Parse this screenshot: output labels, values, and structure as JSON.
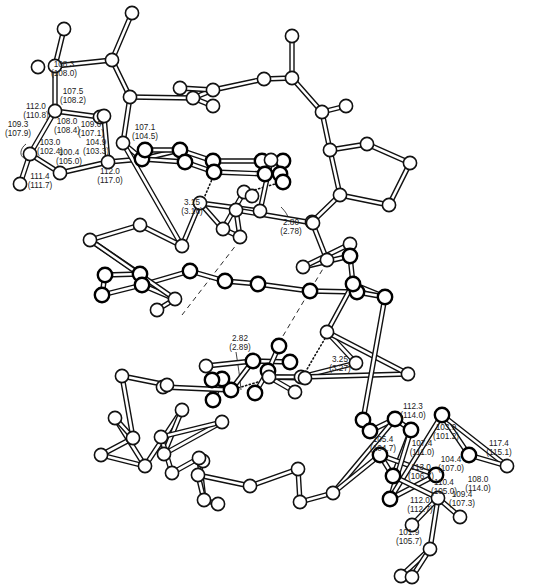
{
  "figure": {
    "angle_labels_upper": [
      {
        "value": "108.3",
        "alt": "(108.0)",
        "x": 64,
        "y": 67
      },
      {
        "value": "107.5",
        "alt": "(108.2)",
        "x": 73,
        "y": 94
      },
      {
        "value": "112.0",
        "alt": "(110.8)",
        "x": 36,
        "y": 109
      },
      {
        "value": "108.0",
        "alt": "(108.4)",
        "x": 67,
        "y": 124
      },
      {
        "value": "109.0",
        "alt": "(107.1)",
        "x": 91,
        "y": 127
      },
      {
        "value": "109.3",
        "alt": "(107.9)",
        "x": 18,
        "y": 127
      },
      {
        "value": "107.1",
        "alt": "(104.5)",
        "x": 145,
        "y": 130
      },
      {
        "value": "103.0",
        "alt": "(102.4)",
        "x": 50,
        "y": 145
      },
      {
        "value": "104.9",
        "alt": "(103.3)",
        "x": 96,
        "y": 145
      },
      {
        "value": "100.4",
        "alt": "(105.0)",
        "x": 69,
        "y": 155
      },
      {
        "value": "112.0",
        "alt": "(117.0)",
        "x": 110,
        "y": 174
      },
      {
        "value": "111.4",
        "alt": "(111.7)",
        "x": 40,
        "y": 179
      }
    ],
    "distance_labels": [
      {
        "value": "3.15",
        "alt": "(3.16)",
        "x": 192,
        "y": 205
      },
      {
        "value": "2.80",
        "alt": "(2.78)",
        "x": 291,
        "y": 225
      },
      {
        "value": "2.82",
        "alt": "(2.89)",
        "x": 240,
        "y": 341
      },
      {
        "value": "3.25",
        "alt": "(3.27)",
        "x": 340,
        "y": 362
      }
    ],
    "angle_labels_lower": [
      {
        "value": "112.3",
        "alt": "(114.0)",
        "x": 413,
        "y": 409
      },
      {
        "value": "103.9",
        "alt": "(101.2)",
        "x": 446,
        "y": 430
      },
      {
        "value": "117.4",
        "alt": "(115.1)",
        "x": 499,
        "y": 446
      },
      {
        "value": "105.4",
        "alt": "(104.7)",
        "x": 383,
        "y": 442
      },
      {
        "value": "107.4",
        "alt": "(111.0)",
        "x": 422,
        "y": 446
      },
      {
        "value": "104.4",
        "alt": "(107.0)",
        "x": 451,
        "y": 462
      },
      {
        "value": "113.0",
        "alt": "(106.7)",
        "x": 421,
        "y": 470
      },
      {
        "value": "108.0",
        "alt": "(114.0)",
        "x": 478,
        "y": 482
      },
      {
        "value": "110.4",
        "alt": "(105.0)",
        "x": 444,
        "y": 485
      },
      {
        "value": "112.0",
        "alt": "(112.7)",
        "x": 420,
        "y": 503
      },
      {
        "value": "109.4",
        "alt": "(107.3)",
        "x": 462,
        "y": 497
      },
      {
        "value": "101.9",
        "alt": "(105.7)",
        "x": 409,
        "y": 535
      }
    ]
  },
  "atoms": [
    [
      64,
      29
    ],
    [
      38,
      67
    ],
    [
      55,
      66
    ],
    [
      112,
      60
    ],
    [
      132,
      13
    ],
    [
      130,
      97
    ],
    [
      100,
      117
    ],
    [
      55,
      111
    ],
    [
      104,
      116
    ],
    [
      30,
      154
    ],
    [
      20,
      184
    ],
    [
      60,
      173
    ],
    [
      108,
      162
    ],
    [
      123,
      143
    ],
    [
      142,
      159
    ],
    [
      145,
      150
    ],
    [
      180,
      150
    ],
    [
      185,
      162
    ],
    [
      213,
      161
    ],
    [
      214,
      172
    ],
    [
      262,
      161
    ],
    [
      265,
      174
    ],
    [
      283,
      161
    ],
    [
      280,
      174
    ],
    [
      283,
      182
    ],
    [
      193,
      98
    ],
    [
      213,
      90
    ],
    [
      180,
      88
    ],
    [
      213,
      106
    ],
    [
      264,
      79
    ],
    [
      292,
      78
    ],
    [
      292,
      36
    ],
    [
      322,
      112
    ],
    [
      346,
      106
    ],
    [
      330,
      150
    ],
    [
      367,
      144
    ],
    [
      410,
      163
    ],
    [
      340,
      195
    ],
    [
      389,
      205
    ],
    [
      312,
      222
    ],
    [
      327,
      260
    ],
    [
      350,
      244
    ],
    [
      303,
      267
    ],
    [
      313,
      223
    ],
    [
      200,
      203
    ],
    [
      244,
      192
    ],
    [
      223,
      229
    ],
    [
      240,
      237
    ],
    [
      236,
      210
    ],
    [
      260,
      211
    ],
    [
      252,
      196
    ],
    [
      271,
      160
    ],
    [
      182,
      246
    ],
    [
      140,
      225
    ],
    [
      90,
      240
    ],
    [
      105,
      275
    ],
    [
      140,
      274
    ],
    [
      102,
      295
    ],
    [
      142,
      285
    ],
    [
      157,
      310
    ],
    [
      190,
      271
    ],
    [
      175,
      299
    ],
    [
      225,
      281
    ],
    [
      258,
      284
    ],
    [
      310,
      291
    ],
    [
      357,
      292
    ],
    [
      350,
      256
    ],
    [
      353,
      284
    ],
    [
      385,
      297
    ],
    [
      327,
      332
    ],
    [
      356,
      363
    ],
    [
      301,
      377
    ],
    [
      408,
      374
    ],
    [
      290,
      362
    ],
    [
      253,
      361
    ],
    [
      231,
      390
    ],
    [
      222,
      379
    ],
    [
      213,
      400
    ],
    [
      212,
      380
    ],
    [
      255,
      393
    ],
    [
      268,
      371
    ],
    [
      279,
      346
    ],
    [
      206,
      366
    ],
    [
      163,
      387
    ],
    [
      167,
      385
    ],
    [
      122,
      376
    ],
    [
      133,
      438
    ],
    [
      115,
      418
    ],
    [
      101,
      455
    ],
    [
      145,
      466
    ],
    [
      182,
      410
    ],
    [
      164,
      454
    ],
    [
      222,
      422
    ],
    [
      203,
      461
    ],
    [
      161,
      437
    ],
    [
      172,
      473
    ],
    [
      199,
      458
    ],
    [
      218,
      504
    ],
    [
      204,
      500
    ],
    [
      198,
      475
    ],
    [
      250,
      486
    ],
    [
      298,
      469
    ],
    [
      300,
      502
    ],
    [
      333,
      493
    ],
    [
      269,
      377
    ],
    [
      305,
      378
    ],
    [
      295,
      392
    ],
    [
      363,
      420
    ],
    [
      370,
      431
    ],
    [
      395,
      419
    ],
    [
      411,
      430
    ],
    [
      380,
      455
    ],
    [
      393,
      476
    ],
    [
      390,
      499
    ],
    [
      436,
      475
    ],
    [
      442,
      415
    ],
    [
      469,
      455
    ],
    [
      507,
      466
    ],
    [
      438,
      498
    ],
    [
      412,
      525
    ],
    [
      460,
      517
    ],
    [
      430,
      549
    ],
    [
      401,
      576
    ],
    [
      412,
      577
    ]
  ],
  "chart_data": {
    "type": "diagram",
    "title": "",
    "hydrogen_bond_distances_A": [
      {
        "label": "3.15",
        "alt": "3.16"
      },
      {
        "label": "2.80",
        "alt": "2.78"
      },
      {
        "label": "2.82",
        "alt": "2.89"
      },
      {
        "label": "3.25",
        "alt": "3.27"
      }
    ],
    "bond_angles_deg": {
      "upper_ring": [
        "108.3 (108.0)",
        "107.5 (108.2)",
        "112.0 (110.8)",
        "108.0 (108.4)",
        "109.0 (107.1)",
        "109.3 (107.9)",
        "107.1 (104.5)",
        "103.0 (102.4)",
        "104.9 (103.3)",
        "100.4 (105.0)",
        "112.0 (117.0)",
        "111.4 (111.7)"
      ],
      "lower_ring": [
        "112.3 (114.0)",
        "103.9 (101.2)",
        "117.4 (115.1)",
        "105.4 (104.7)",
        "107.4 (111.0)",
        "104.4 (107.0)",
        "113.0 (106.7)",
        "108.0 (114.0)",
        "110.4 (105.0)",
        "112.0 (112.7)",
        "109.4 (107.3)",
        "101.9 (105.7)"
      ]
    }
  }
}
